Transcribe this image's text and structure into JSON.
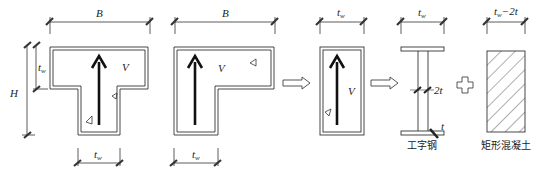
{
  "figure": {
    "panels": [
      {
        "id": "t-section",
        "shape": "T-shaped wall section",
        "labels": {
          "top_width": "B",
          "height": "H",
          "flange_thickness": "t",
          "flange_thickness_sub": "w",
          "web_width": "t",
          "web_width_sub": "w",
          "shear": "V"
        }
      },
      {
        "id": "l-section",
        "shape": "L-shaped wall section",
        "labels": {
          "top_width": "B",
          "leg_width": "t",
          "leg_width_sub": "w",
          "shear": "V"
        }
      },
      {
        "id": "rect-section",
        "shape": "rectangular web section",
        "labels": {
          "width": "t",
          "width_sub": "w",
          "shear": "V"
        }
      },
      {
        "id": "i-steel",
        "shape": "I-section steel",
        "labels": {
          "width": "t",
          "width_sub": "w",
          "web_thickness": "2t",
          "flange_thickness": "t"
        },
        "caption": "工字钢"
      },
      {
        "id": "rect-concrete",
        "shape": "hatched rectangular concrete",
        "labels": {
          "width_prefix": "t",
          "width_sub": "w",
          "width_suffix": "−2t"
        },
        "caption": "矩形混凝土"
      }
    ],
    "connectors": [
      "arrow-right",
      "arrow-right",
      "plus"
    ],
    "colors": {
      "line": "#333333",
      "arrow": "#111111",
      "background": "#ffffff"
    }
  }
}
